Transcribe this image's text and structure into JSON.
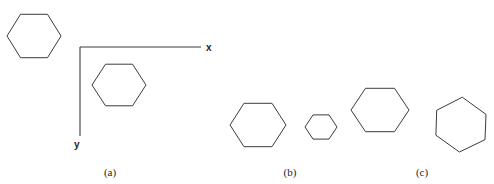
{
  "figure": {
    "background_color": "#ffffff",
    "stroke_color": "#3b3b3b",
    "text_color": "#262626",
    "width": 494,
    "height": 184
  },
  "axes": {
    "x_label": "x",
    "y_label": "y",
    "origin": {
      "x": 80,
      "y": 47
    },
    "x_end": {
      "x": 201,
      "y": 47
    },
    "y_end": {
      "x": 80,
      "y": 136
    }
  },
  "panels": [
    {
      "id": "a",
      "label": "(a)",
      "label_x": 110,
      "label_y": 176
    },
    {
      "id": "b",
      "label": "(b)",
      "label_x": 290,
      "label_y": 176
    },
    {
      "id": "c",
      "label": "(c)",
      "label_x": 422,
      "label_y": 176
    }
  ],
  "shapes": [
    {
      "name": "hexagon-original-a",
      "panel": "a",
      "sides": 6,
      "center_x": 34,
      "center_y": 36,
      "radius_x": 27,
      "radius_y": 25,
      "rotation_deg": 0,
      "points": "7,36 20.5,14.3 47.5,14.3 61,36 47.5,57.7 20.5,57.7"
    },
    {
      "name": "hexagon-translated-a",
      "panel": "a",
      "sides": 6,
      "center_x": 119,
      "center_y": 85,
      "radius_x": 27,
      "radius_y": 24,
      "rotation_deg": 0,
      "points": "92,85 105.5,64.2 132.5,64.2 146,85 132.5,105.8 105.5,105.8"
    },
    {
      "name": "hexagon-reference-b",
      "panel": "b",
      "sides": 6,
      "center_x": 258,
      "center_y": 125,
      "radius_x": 28,
      "radius_y": 25,
      "rotation_deg": 0,
      "points": "230,125 244,103.3 272,103.3 286,125 272,146.7 244,146.7"
    },
    {
      "name": "hexagon-scaled-down-b",
      "panel": "b",
      "sides": 6,
      "center_x": 321,
      "center_y": 127,
      "radius_x": 16,
      "radius_y": 14,
      "rotation_deg": 0,
      "points": "305,127 313,114.9 329,114.9 337,127 329,139.1 313,139.1"
    },
    {
      "name": "hexagon-scaled-up-b",
      "panel": "b",
      "sides": 6,
      "center_x": 380,
      "center_y": 110,
      "radius_x": 29,
      "radius_y": 25,
      "rotation_deg": 0,
      "points": "351,110 365.5,88.3 394.5,88.3 409,110 394.5,131.7 365.5,131.7"
    },
    {
      "name": "hexagon-rotated-c",
      "panel": "c",
      "sides": 6,
      "center_x": 461,
      "center_y": 124,
      "radius_x": 28,
      "radius_y": 28,
      "rotation_deg": 20,
      "points": "436.7,110.3 462.3,97.2 486.0,114.4 485.0,139.7 459.4,152.0 435.9,135.2"
    }
  ]
}
